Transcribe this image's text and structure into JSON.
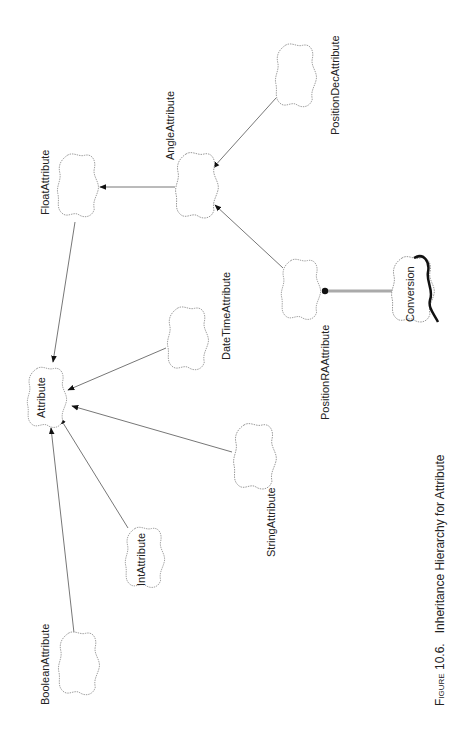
{
  "figure": {
    "caption_prefix": "Figure 10.6.",
    "caption_text": "Inheritance Hierarchy for Attribute"
  },
  "nodes": {
    "attribute": "Attribute",
    "float": "FloatAttribute",
    "angle": "AngleAttribute",
    "position_dec": "PositionDecAttribute",
    "position_ra": "PositionRAAttribute",
    "datetime": "DateTimeAttribute",
    "string": "StringAttribute",
    "int": "IntAttribute",
    "boolean": "BooleanAttribute",
    "conversion": "Conversion"
  },
  "edges": [
    {
      "from": "FloatAttribute",
      "to": "Attribute",
      "type": "inheritance"
    },
    {
      "from": "AngleAttribute",
      "to": "FloatAttribute",
      "type": "inheritance"
    },
    {
      "from": "PositionDecAttribute",
      "to": "AngleAttribute",
      "type": "inheritance"
    },
    {
      "from": "PositionRAAttribute",
      "to": "AngleAttribute",
      "type": "inheritance"
    },
    {
      "from": "DateTimeAttribute",
      "to": "Attribute",
      "type": "inheritance"
    },
    {
      "from": "StringAttribute",
      "to": "Attribute",
      "type": "inheritance"
    },
    {
      "from": "IntAttribute",
      "to": "Attribute",
      "type": "inheritance"
    },
    {
      "from": "BooleanAttribute",
      "to": "Attribute",
      "type": "inheritance"
    },
    {
      "from": "PositionRAAttribute",
      "to": "Conversion",
      "type": "uses"
    }
  ]
}
